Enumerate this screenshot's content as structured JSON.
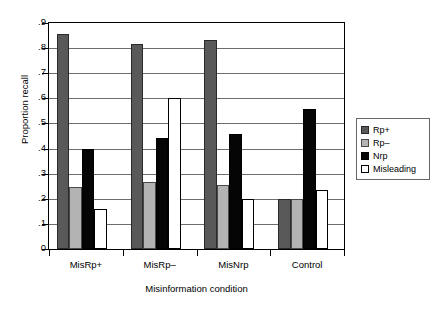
{
  "chart_data": {
    "type": "bar",
    "title": "",
    "xlabel": "Misinformation condition",
    "ylabel": "Proportion recall",
    "categories": [
      "MisRp+",
      "MisRp–",
      "MisNrp",
      "Control"
    ],
    "ylim": [
      0,
      0.9
    ],
    "ytick_labels": [
      "0",
      ".1",
      ".2",
      ".3",
      ".4",
      ".5",
      ".6",
      ".7",
      ".8",
      ".9"
    ],
    "ytick_values": [
      0,
      0.1,
      0.2,
      0.3,
      0.4,
      0.5,
      0.6,
      0.7,
      0.8,
      0.9
    ],
    "grid": "horizontal",
    "legend_position": "right",
    "series": [
      {
        "name": "Rp+",
        "color": "#595959",
        "values": [
          0.855,
          0.818,
          0.832,
          0.2
        ]
      },
      {
        "name": "Rp–",
        "color": "#b3b3b3",
        "values": [
          0.248,
          0.267,
          0.255,
          0.2
        ]
      },
      {
        "name": "Nrp",
        "color": "#050505",
        "values": [
          0.398,
          0.443,
          0.457,
          0.558
        ]
      },
      {
        "name": "Misleading",
        "color": "#ffffff",
        "values": [
          0.158,
          0.602,
          0.2,
          0.235
        ]
      }
    ]
  },
  "axes": {
    "y_title": "Proportion recall",
    "x_title": "Misinformation condition"
  },
  "legend": {
    "items": [
      {
        "label": "Rp+",
        "swatch": "dark-gray-swatch"
      },
      {
        "label": "Rp–",
        "swatch": "light-gray-swatch"
      },
      {
        "label": "Nrp",
        "swatch": "black-swatch"
      },
      {
        "label": "Misleading",
        "swatch": "white-swatch"
      }
    ]
  }
}
